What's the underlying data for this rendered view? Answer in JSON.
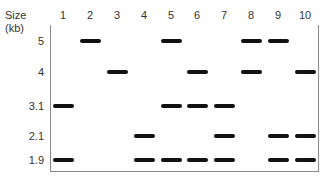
{
  "header": {
    "size_label": "Size",
    "unit_label": "(kb)"
  },
  "lanes": [
    "1",
    "2",
    "3",
    "4",
    "5",
    "6",
    "7",
    "8",
    "9",
    "10"
  ],
  "sizes": [
    "5",
    "4",
    "3.1",
    "2.1",
    "1.9"
  ],
  "colors": {
    "band": "#111111",
    "frame": "#8a8a8a",
    "text": "#333333"
  },
  "bands": {
    "1": [
      "3.1",
      "1.9"
    ],
    "2": [
      "5"
    ],
    "3": [
      "4"
    ],
    "4": [
      "2.1",
      "1.9"
    ],
    "5": [
      "5",
      "3.1",
      "1.9"
    ],
    "6": [
      "4",
      "3.1",
      "1.9"
    ],
    "7": [
      "3.1",
      "2.1",
      "1.9"
    ],
    "8": [
      "5",
      "4"
    ],
    "9": [
      "5",
      "2.1",
      "1.9"
    ],
    "10": [
      "4",
      "2.1",
      "1.9"
    ]
  }
}
